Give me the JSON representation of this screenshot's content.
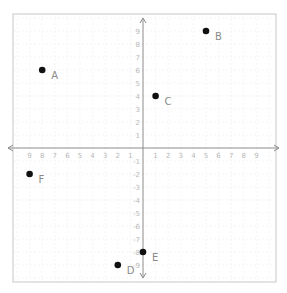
{
  "chart_data": {
    "type": "scatter",
    "title": "",
    "xlabel": "",
    "ylabel": "",
    "xlim": [
      -10,
      10
    ],
    "ylim": [
      -10,
      10
    ],
    "grid": true,
    "legend": null,
    "x_tick_labels_negative": [
      "9",
      "8",
      "7",
      "6",
      "5",
      "4",
      "3",
      "2",
      "1"
    ],
    "x_tick_labels_positive": [
      "1",
      "2",
      "3",
      "4",
      "5",
      "6",
      "7",
      "8",
      "9"
    ],
    "y_tick_labels_positive": [
      "1",
      "2",
      "3",
      "4",
      "5",
      "6",
      "7",
      "8",
      "9"
    ],
    "y_tick_labels_negative": [
      "-1",
      "-2",
      "-3",
      "-4",
      "-5",
      "-6",
      "-7",
      "-8",
      "-9"
    ],
    "points": [
      {
        "label": "A",
        "x": -8,
        "y": 6
      },
      {
        "label": "B",
        "x": 5,
        "y": 9
      },
      {
        "label": "C",
        "x": 1,
        "y": 4
      },
      {
        "label": "D",
        "x": -2,
        "y": -9
      },
      {
        "label": "E",
        "x": 0,
        "y": -8
      },
      {
        "label": "F",
        "x": -9,
        "y": -2
      }
    ]
  },
  "colors": {
    "frame": "#c8c8c8",
    "grid": "#ececec",
    "axis": "#8c8c8c",
    "point": "#111111",
    "point_label": "#8a8a8a",
    "tick_label": "#b8b8b8"
  }
}
